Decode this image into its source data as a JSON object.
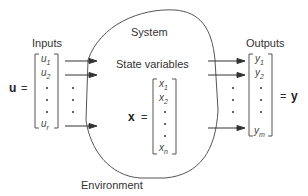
{
  "diagram": {
    "system_label": "System",
    "environment_label": "Environment",
    "state_label": "State variables",
    "inputs": {
      "label": "Inputs",
      "vector_name": "u",
      "equals": "=",
      "entries": [
        "u1",
        "u2",
        "•",
        "•",
        "•",
        "ur"
      ],
      "entries_display": [
        {
          "base": "u",
          "sub": "1"
        },
        {
          "base": "u",
          "sub": "2"
        },
        {
          "base": "u",
          "sub": "r"
        }
      ]
    },
    "state": {
      "vector_name": "x",
      "equals": "=",
      "entries": [
        "x1",
        "x2",
        "•",
        "•",
        "•",
        "xn"
      ],
      "entries_display": [
        {
          "base": "x",
          "sub": "1"
        },
        {
          "base": "x",
          "sub": "2"
        },
        {
          "base": "x",
          "sub": "n"
        }
      ]
    },
    "outputs": {
      "label": "Outputs",
      "vector_name": "y",
      "equals": "=",
      "entries": [
        "y1",
        "y2",
        "•",
        "•",
        "•",
        "ym"
      ],
      "entries_display": [
        {
          "base": "y",
          "sub": "1"
        },
        {
          "base": "y",
          "sub": "2"
        },
        {
          "base": "y",
          "sub": "m"
        }
      ]
    },
    "colors": {
      "line": "#444444",
      "text": "#333333",
      "background": "#ffffff"
    }
  }
}
